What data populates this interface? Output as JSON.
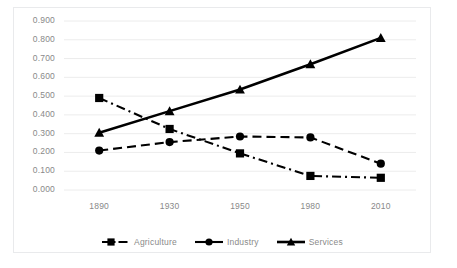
{
  "chart_data": {
    "type": "line",
    "title": "",
    "subtitle": "",
    "xlabel": "",
    "ylabel": "",
    "categories": [
      "1890",
      "1930",
      "1950",
      "1980",
      "2010"
    ],
    "ylim": [
      0.0,
      0.9
    ],
    "ytick_labels": [
      "0.900",
      "0.800",
      "0.700",
      "0.600",
      "0.500",
      "0.400",
      "0.300",
      "0.200",
      "0.100",
      "0.000"
    ],
    "ytick_values": [
      0.9,
      0.8,
      0.7,
      0.6,
      0.5,
      0.4,
      0.3,
      0.2,
      0.1,
      0.0
    ],
    "grid": true,
    "grid_axis": "y",
    "legend_position": "bottom",
    "series": [
      {
        "name": "Agriculture",
        "values": [
          0.49,
          0.325,
          0.195,
          0.075,
          0.065
        ],
        "marker": "square",
        "line_style": "dash-dot",
        "color": "#000000"
      },
      {
        "name": "Industry",
        "values": [
          0.21,
          0.255,
          0.285,
          0.28,
          0.14
        ],
        "marker": "circle",
        "line_style": "dashed",
        "color": "#000000"
      },
      {
        "name": "Services",
        "values": [
          0.305,
          0.42,
          0.535,
          0.67,
          0.81
        ],
        "marker": "triangle",
        "line_style": "solid",
        "color": "#000000"
      }
    ]
  },
  "legend": {
    "items": [
      {
        "label": "Agriculture",
        "marker": "square-marker-icon"
      },
      {
        "label": "Industry",
        "marker": "circle-marker-icon"
      },
      {
        "label": "Services",
        "marker": "triangle-marker-icon"
      }
    ]
  },
  "colors": {
    "series": "#000000",
    "grid": "#ececec",
    "frame_border": "#e9eaec",
    "tick_text": "#8b8b8b",
    "background": "#ffffff"
  }
}
